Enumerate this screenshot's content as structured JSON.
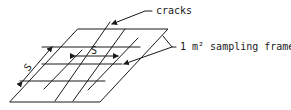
{
  "diagram": {
    "labels": {
      "cracks": "cracks",
      "frame": "1 m² sampling frame",
      "spacing_horizontal": "S",
      "spacing_diagonal": "S"
    },
    "elements": [
      "sampling-frame-parallelogram",
      "horizontal-cracks",
      "diagonal-cracks",
      "spacing-dimension-arrows",
      "leader-lines"
    ],
    "colors": {
      "line": "#1a1a1a",
      "background": "#ffffff"
    }
  }
}
